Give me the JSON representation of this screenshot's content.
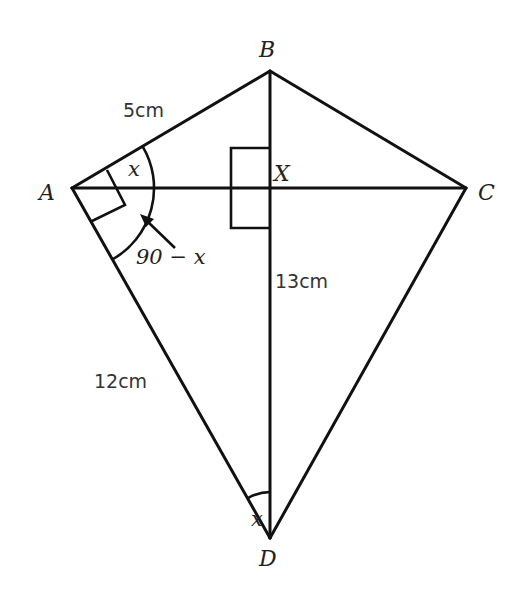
{
  "diagram": {
    "vertices": {
      "A": {
        "label": "A",
        "x": 72,
        "y": 188
      },
      "B": {
        "label": "B",
        "x": 270,
        "y": 71
      },
      "C": {
        "label": "C",
        "x": 466,
        "y": 188
      },
      "D": {
        "label": "D",
        "x": 270,
        "y": 538
      },
      "X": {
        "label": "X",
        "x": 270,
        "y": 188
      }
    },
    "lengths": {
      "AB": "5cm",
      "AD": "12cm",
      "BD": "13cm"
    },
    "angles": {
      "BAC": "x",
      "CAD": "90 − x",
      "ADB": "x"
    },
    "right_angles": [
      "BAD",
      "AXB"
    ],
    "colors": {
      "stroke": "#111111",
      "text": "#222222",
      "background": "#ffffff"
    }
  }
}
